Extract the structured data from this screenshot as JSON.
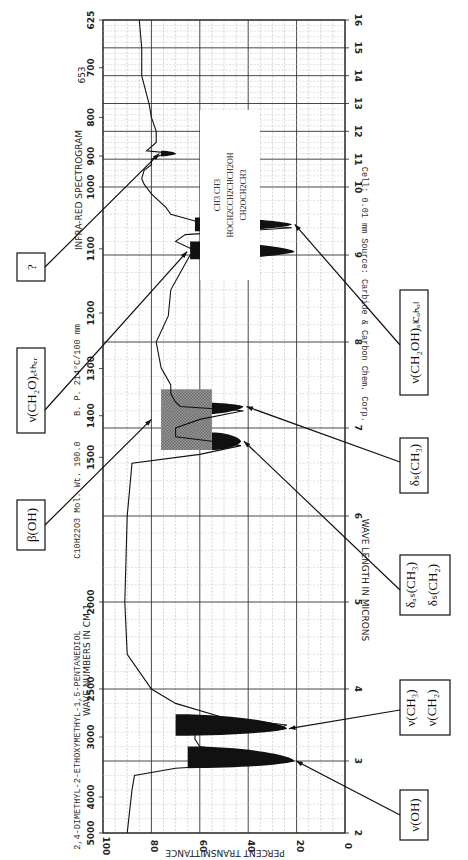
{
  "chart_data": {
    "type": "line",
    "title": "INFRA-RED SPECTROGRAM",
    "compound": "2,4-DIMETHYL-2-ETHOXYMETHYL-1,5-PENTANEDIOL",
    "formula": "C10H22O3",
    "mol_wt": "Mol. Wt. 190.0",
    "bp": "B. P. 214°C/100 mm",
    "source": "Source: Carbide & Carbon Chem. Corp.",
    "cell": "Cell: 0.01 mm",
    "spectrum_number": "653",
    "structure_lines": [
      "CH3  CH3",
      "HOCH2CCH2CHCH2OH",
      "CH2OCH2CH3"
    ],
    "xlabel_top": "WAVE NUMBERS IN CM-1",
    "xlabel_bottom": "WAVE LENGTH IN MICRONS",
    "ylabel": "PERCENT TRANSMITTANCE",
    "y_ticks": [
      "0",
      "20",
      "40",
      "60",
      "80",
      "100"
    ],
    "micron_ticks": [
      "2",
      "3",
      "4",
      "5",
      "6",
      "7",
      "8",
      "9",
      "10",
      "11",
      "12",
      "13",
      "14",
      "15",
      "16"
    ],
    "wavenumber_ticks": [
      "5000",
      "4000",
      "3000",
      "2500",
      "2000",
      "1500",
      "1400",
      "1300",
      "1200",
      "1100",
      "1000",
      "900",
      "800",
      "700",
      "625"
    ],
    "ylim": [
      0,
      100
    ],
    "xlim_microns": [
      2,
      16
    ],
    "spectrum_microns": [
      2.0,
      2.3,
      2.6,
      2.8,
      2.9,
      3.0,
      3.1,
      3.2,
      3.3,
      3.38,
      3.42,
      3.5,
      3.6,
      3.8,
      4.0,
      4.2,
      4.4,
      5.0,
      6.0,
      6.6,
      6.7,
      6.8,
      6.85,
      6.9,
      7.0,
      7.1,
      7.2,
      7.25,
      7.3,
      7.4,
      7.5,
      7.7,
      8.0,
      8.3,
      8.6,
      8.8,
      9.0,
      9.05,
      9.1,
      9.2,
      9.3,
      9.4,
      9.5,
      9.6,
      9.7,
      9.9,
      10.1,
      10.3,
      10.6,
      10.8,
      11.0,
      11.15,
      11.2,
      11.3,
      11.6,
      12.0,
      12.5,
      13.0,
      14.0,
      15.0,
      16.0
    ],
    "spectrum_transmittance": [
      90,
      89,
      88,
      87,
      70,
      22,
      40,
      60,
      62,
      62,
      30,
      24,
      50,
      70,
      80,
      85,
      90,
      91,
      90,
      88,
      60,
      43,
      55,
      70,
      70,
      60,
      42,
      68,
      70,
      72,
      72,
      76,
      78,
      73,
      72,
      68,
      64,
      21,
      64,
      70,
      66,
      22,
      62,
      72,
      74,
      80,
      83,
      84,
      83,
      80,
      80,
      76,
      70,
      82,
      78,
      78,
      80,
      81,
      84,
      84,
      85
    ],
    "annotations": [
      {
        "label": "ν(OH)",
        "microns": 3.0,
        "transmittance": 21
      },
      {
        "label": "ν(CH3) ν(CH2)",
        "microns": 3.45,
        "transmittance": 24
      },
      {
        "label": "δas(CH3) δs(CH2)",
        "microns": 6.85,
        "transmittance": 43
      },
      {
        "label": "β(OH)",
        "microns": 7.1,
        "transmittance": 70
      },
      {
        "label": "δs(CH3)",
        "microns": 7.25,
        "transmittance": 42
      },
      {
        "label": "ν(CH2O)ether",
        "microns": 9.05,
        "transmittance": 30
      },
      {
        "label": "ν(CH2OH)alcohol",
        "microns": 9.55,
        "transmittance": 22
      },
      {
        "label": "?",
        "microns": 11.2,
        "transmittance": 70
      }
    ],
    "grid": true
  },
  "labels": {
    "oh": "ν(OH)",
    "ch3": "ν(CH",
    "ch2": "ν(CH",
    "das": "δ",
    "ds": "δ",
    "beta": "β(OH)",
    "dsch3": "δ",
    "ether": "ν(CH",
    "alcohol": "ν(CH",
    "q": "?"
  }
}
